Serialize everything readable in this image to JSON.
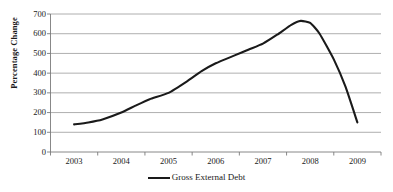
{
  "chart_data": {
    "type": "line",
    "title": "",
    "xlabel": "",
    "ylabel": "Percentage Change",
    "ylim": [
      0,
      700
    ],
    "ytick_values": [
      0,
      100,
      200,
      300,
      400,
      500,
      600,
      700
    ],
    "ytick_labels": [
      "0",
      "100",
      "200",
      "300",
      "400",
      "500",
      "600",
      "700"
    ],
    "xtick_labels": [
      "2003",
      "2004",
      "2005",
      "2006",
      "2007",
      "2008",
      "2009"
    ],
    "grid": "horizontal",
    "legend_position": "bottom-center",
    "line_color": "#1a1a1a",
    "grid_color": "#9a9a9a",
    "series": [
      {
        "name": "Gross External Debt",
        "x": [
          "2003",
          "2004",
          "2005",
          "2006",
          "2007",
          "2008",
          "2009"
        ],
        "values": [
          140,
          200,
          300,
          450,
          550,
          640,
          150
        ],
        "detailed_points": [
          {
            "x": 2003.0,
            "y": 140
          },
          {
            "x": 2003.3,
            "y": 150
          },
          {
            "x": 2003.6,
            "y": 165
          },
          {
            "x": 2004.0,
            "y": 200
          },
          {
            "x": 2004.3,
            "y": 235
          },
          {
            "x": 2004.6,
            "y": 268
          },
          {
            "x": 2005.0,
            "y": 300
          },
          {
            "x": 2005.4,
            "y": 360
          },
          {
            "x": 2005.7,
            "y": 410
          },
          {
            "x": 2006.0,
            "y": 450
          },
          {
            "x": 2006.4,
            "y": 490
          },
          {
            "x": 2006.7,
            "y": 520
          },
          {
            "x": 2007.0,
            "y": 550
          },
          {
            "x": 2007.3,
            "y": 595
          },
          {
            "x": 2007.6,
            "y": 645
          },
          {
            "x": 2007.8,
            "y": 665
          },
          {
            "x": 2008.0,
            "y": 655
          },
          {
            "x": 2008.2,
            "y": 600
          },
          {
            "x": 2008.5,
            "y": 470
          },
          {
            "x": 2008.75,
            "y": 330
          },
          {
            "x": 2009.0,
            "y": 150
          }
        ],
        "peak_value": 665,
        "peak_x": "late 2007"
      }
    ]
  },
  "legend": {
    "entries": [
      {
        "label": "Gross External Debt",
        "marker": "line-swatch"
      }
    ]
  },
  "axis": {
    "y_title": "Percentage Change"
  }
}
